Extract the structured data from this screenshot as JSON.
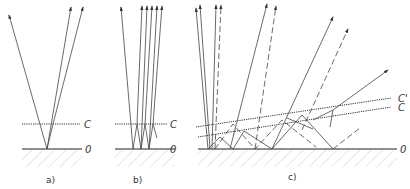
{
  "figure": {
    "panels": [
      {
        "id": "a",
        "caption": "a)",
        "layer_label": "C",
        "surface_label": "0"
      },
      {
        "id": "b",
        "caption": "b)",
        "layer_label": "C",
        "surface_label": "0"
      },
      {
        "id": "c",
        "caption": "c)",
        "layer_labels": [
          "C'",
          "C"
        ],
        "surface_label": "0"
      }
    ],
    "colors": {
      "line": "#444444",
      "hatch": "#aaaaaa",
      "background": "#ffffff"
    }
  }
}
